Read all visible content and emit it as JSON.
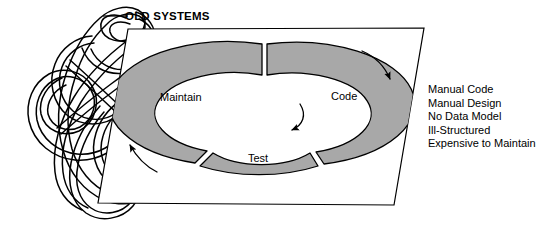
{
  "figure": {
    "title": "OLD SYSTEMS",
    "background_color": "#ffffff",
    "line_color": "#000000",
    "segment_fill_color": "#a8a8a8",
    "panel_fill_color": "#ffffff"
  },
  "cycle": {
    "name": "old-systems-lifecycle-donut",
    "direction_note": "clockwise",
    "segments": [
      {
        "id": "maintain",
        "label": "Maintain",
        "position": "left"
      },
      {
        "id": "code",
        "label": "Code",
        "position": "right"
      },
      {
        "id": "test",
        "label": "Test",
        "position": "bottom"
      }
    ],
    "arrows": [
      {
        "id": "outer-right-arrow",
        "label": "",
        "direction": "down-right"
      },
      {
        "id": "outer-left-arrow",
        "label": "",
        "direction": "up-left"
      },
      {
        "id": "inner-arrow",
        "label": "",
        "direction": "down-left"
      }
    ]
  },
  "attributes": {
    "items": [
      "Manual Code",
      "Manual Design",
      "No Data Model",
      "Ill-Structured",
      "Expensive to Maintain"
    ],
    "text": "Manual Code\nManual Design\nNo Data Model\nIll-Structured\nExpensive to Maintain"
  },
  "tangle": {
    "name": "spaghetti-tangle-icon",
    "description": "tangled looping ribbon"
  }
}
